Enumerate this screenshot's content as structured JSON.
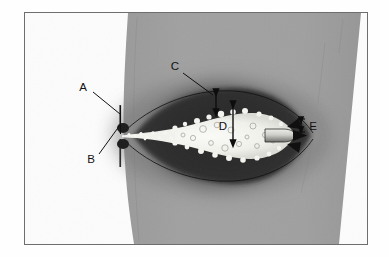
{
  "figure": {
    "kind": "annotated-photograph",
    "frame": {
      "border_color": "#6e6e6e",
      "outer_background": "#ffffff",
      "inner_background": "#fcfcfc"
    }
  },
  "palette": {
    "page_white": "#ffffff",
    "field_gray": "#9e9e9e",
    "field_gray_dark": "#8f8f8f",
    "plume_dark": "#3a3a3a",
    "plume_darkest": "#222222",
    "plume_core_white": "#f6f6f2",
    "ink_black": "#111111",
    "frame_border": "#6e6e6e"
  },
  "labels": [
    {
      "id": "A",
      "text": "A",
      "x": 86,
      "y": 98,
      "role": "callout-nozzle-exit-upper",
      "leader": [
        [
          92,
          101
        ],
        [
          119,
          113
        ]
      ]
    },
    {
      "id": "B",
      "text": "B",
      "x": 92,
      "y": 158,
      "role": "callout-nozzle-exit-lower",
      "leader": [
        [
          96,
          152
        ],
        [
          119,
          125
        ]
      ]
    },
    {
      "id": "C",
      "text": "C",
      "x": 176,
      "y": 68,
      "role": "callout-shear-layer-thickness",
      "leader": [
        [
          182,
          71
        ],
        [
          212,
          93
        ]
      ]
    },
    {
      "id": "D",
      "text": "D",
      "x": 222,
      "y": 125,
      "role": "dimension-core-diameter"
    },
    {
      "id": "E",
      "text": "E",
      "x": 308,
      "y": 126,
      "role": "dimension-tip-gap"
    }
  ],
  "dimensions": [
    {
      "id": "C-arrow",
      "type": "double-headed-vertical-arrow",
      "x": 215,
      "y_top": 92,
      "y_bottom": 112,
      "measures": "cavitation cloud outer boundary offset"
    },
    {
      "id": "D-arrow",
      "type": "double-headed-vertical-arrow",
      "x": 232,
      "y_top": 104,
      "y_bottom": 143,
      "measures": "bright cavitation core height"
    },
    {
      "id": "E-arrow",
      "type": "double-headed-vertical-arrow-with-end-bars",
      "x": 300,
      "y_top": 118,
      "y_bottom": 131,
      "measures": "small tip gap"
    }
  ],
  "features": {
    "orifice_plate": {
      "x": 119,
      "y_top": 104,
      "y_bottom": 134,
      "description": "thin vertical orifice tick at jet origin"
    },
    "jet_axis_y": 123,
    "jet_origin_x": 122,
    "jet_tip_x": 290,
    "nozzle_body": {
      "x": 262,
      "y": 123,
      "w": 24,
      "h": 13,
      "description": "rounded bullet-shaped target body at jet tip"
    },
    "converging_arrowheads": {
      "x": 292,
      "y": 123,
      "count": 3,
      "description": "arrowheads converging on the tip"
    },
    "gray_field": {
      "top_left_x": 127,
      "bottom_left_x": 133,
      "top_right_x": 360,
      "bottom_right_x": 338,
      "description": "gray liquid-filled test section, left edge bows outward, right edge slants"
    }
  },
  "annotation_count": 5
}
